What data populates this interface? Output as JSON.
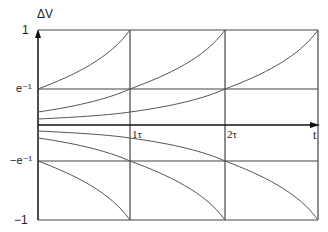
{
  "diagram": {
    "y_axis_label": "ΔV",
    "x_axis_label": "t",
    "y_ticks": [
      {
        "label": "1",
        "value": 1
      },
      {
        "label": "e⁻¹",
        "value": 0.3679
      },
      {
        "label": "−e⁻¹",
        "value": -0.3679
      },
      {
        "label": "−1",
        "value": -1
      }
    ],
    "x_ticks": [
      {
        "label": "1τ",
        "value": 1
      },
      {
        "label": "2τ",
        "value": 2
      }
    ],
    "colors": {
      "axis": "#111111",
      "grid": "#444444",
      "curve": "#555555"
    }
  }
}
